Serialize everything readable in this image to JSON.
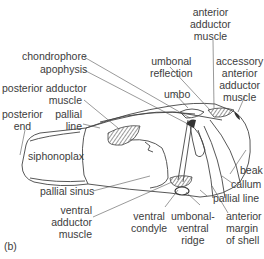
{
  "figure": {
    "panel_label": "(b)",
    "labels": {
      "anterior_adductor_muscle": [
        "anterior",
        "adductor",
        "muscle"
      ],
      "chondrophore": "chondrophore",
      "apophysis": "apophysis",
      "umbonal_reflection": [
        "umbonal",
        "reflection"
      ],
      "accessory_anterior_adductor_muscle": [
        "accessory",
        "anterior",
        "adductor",
        "muscle"
      ],
      "posterior_adductor_muscle": [
        "posterior adductor",
        "muscle"
      ],
      "umbo": "umbo",
      "posterior_end": [
        "posterior",
        "end"
      ],
      "pallial_line_left": [
        "pallial",
        "line"
      ],
      "siphonoplax": "siphonoplax",
      "pallial_sinus": "pallial sinus",
      "ventral_adductor_muscle": [
        "ventral",
        "adductor",
        "muscle"
      ],
      "beak": "beak",
      "callum": "callum",
      "pallial_line_right": "pallial line",
      "ventral_condyle": [
        "ventral",
        "condyle"
      ],
      "umbonal_ventral_ridge": [
        "umbonal-",
        "ventral",
        "ridge"
      ],
      "anterior_margin_of_shell": [
        "anterior",
        "margin",
        "of shell"
      ]
    }
  }
}
